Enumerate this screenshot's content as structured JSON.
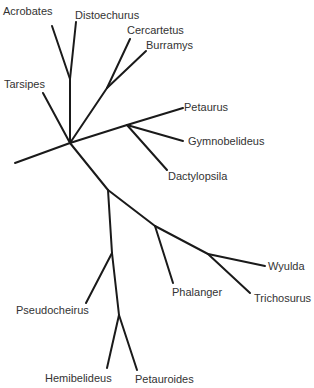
{
  "diagram": {
    "type": "unrooted-phylogenetic-tree",
    "taxa": [
      {
        "id": "acrobates",
        "label": "Acrobates"
      },
      {
        "id": "distoechurus",
        "label": "Distoechurus"
      },
      {
        "id": "cercartetus",
        "label": "Cercartetus"
      },
      {
        "id": "burramys",
        "label": "Burramys"
      },
      {
        "id": "tarsipes",
        "label": "Tarsipes"
      },
      {
        "id": "petaurus",
        "label": "Petaurus"
      },
      {
        "id": "gymnobelideus",
        "label": "Gymnobelideus"
      },
      {
        "id": "dactylopsila",
        "label": "Dactylopsila"
      },
      {
        "id": "wyulda",
        "label": "Wyulda"
      },
      {
        "id": "phalanger",
        "label": "Phalanger"
      },
      {
        "id": "trichosurus",
        "label": "Trichosurus"
      },
      {
        "id": "pseudocheirus",
        "label": "Pseudocheirus"
      },
      {
        "id": "hemibelideus",
        "label": "Hemibelideus"
      },
      {
        "id": "petauroides",
        "label": "Petauroides"
      }
    ],
    "topology": [
      {
        "clade": "acrobatidae",
        "members": [
          "acrobates",
          "distoechurus"
        ]
      },
      {
        "clade": "burramyidae",
        "members": [
          "cercartetus",
          "burramys"
        ]
      },
      {
        "clade": "tarsipedidae",
        "members": [
          "tarsipes"
        ]
      },
      {
        "clade": "petauridae",
        "members": [
          "petaurus",
          "gymnobelideus",
          "dactylopsila"
        ]
      },
      {
        "clade": "phalangeridae",
        "members": [
          "phalanger",
          "wyulda",
          "trichosurus"
        ]
      },
      {
        "clade": "pseudocheiridae",
        "members": [
          "pseudocheirus",
          "hemibelideus",
          "petauroides"
        ]
      }
    ]
  }
}
